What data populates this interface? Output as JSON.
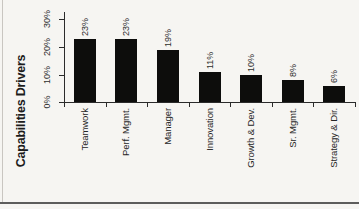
{
  "figure": {
    "kind": "scanned book figure",
    "background_color": "#f6f5f2",
    "left_rule_color": "#c9c6c1",
    "bottom_rule_color": "#5d5d5c"
  },
  "chart_data": {
    "type": "bar",
    "title": "Capabilities Drivers",
    "categories": [
      "Teamwork",
      "Perf. Mgmt.",
      "Manager",
      "Innovation",
      "Growth & Dev.",
      "Sr. Mgmt.",
      "Strategy & Dir."
    ],
    "values": [
      23,
      23,
      19,
      11,
      10,
      8,
      6
    ],
    "data_labels": [
      "23%",
      "23%",
      "19%",
      "11%",
      "10%",
      "8%",
      "6%"
    ],
    "y_ticks": [
      "0%",
      "10%",
      "20%",
      "30%"
    ],
    "y_tick_values": [
      0,
      10,
      20,
      30
    ],
    "ylim": [
      0,
      30
    ],
    "grid": false,
    "legend": false,
    "labels_rotated_90ccw": true,
    "bar_color": "#0d0d0c",
    "axis_color": "#2b2b2b",
    "text_color": "#2e2e2e"
  }
}
